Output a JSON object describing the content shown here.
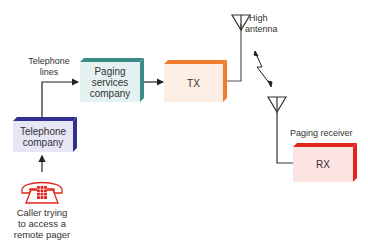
{
  "diagram": {
    "type": "paging-system-block-diagram",
    "nodes": [
      {
        "id": "telephone-company",
        "label": "Telephone company",
        "color": "#2e3192",
        "fill": "#e6e6f5"
      },
      {
        "id": "paging-services",
        "label": "Paging services company",
        "color": "#3b8c86",
        "fill": "#e6f2f1"
      },
      {
        "id": "tx",
        "label": "TX",
        "color": "#f07d2e",
        "fill": "#fdeee3"
      },
      {
        "id": "rx",
        "label": "RX",
        "color": "#e0261f",
        "fill": "#fbe4e1"
      }
    ],
    "labels": {
      "telephone_lines_1": "Telephone",
      "telephone_lines_2": "lines",
      "paging_1": "Paging",
      "paging_2": "services",
      "paging_3": "company",
      "tx": "TX",
      "rx": "RX",
      "tel_1": "Telephone",
      "tel_2": "company",
      "high_1": "High",
      "high_2": "antenna",
      "receiver": "Paging receiver",
      "caller_1": "Caller trying",
      "caller_2": "to access a",
      "caller_3": "remote pager"
    },
    "edges": [
      {
        "from": "caller-phone",
        "to": "telephone-company"
      },
      {
        "from": "telephone-company",
        "to": "paging-services",
        "label": "Telephone lines"
      },
      {
        "from": "paging-services",
        "to": "tx"
      },
      {
        "from": "tx",
        "to": "high-antenna"
      },
      {
        "from": "high-antenna",
        "to": "receiver-antenna",
        "type": "radio"
      },
      {
        "from": "receiver-antenna",
        "to": "rx"
      }
    ]
  }
}
